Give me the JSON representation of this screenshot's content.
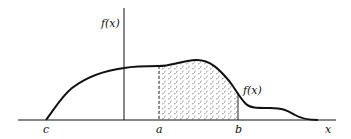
{
  "figure": {
    "type": "probability-density-diagram",
    "y_axis_label": "f(x)",
    "curve_label": "f(x)",
    "x_axis_label": "x",
    "x_markers": [
      "c",
      "a",
      "b"
    ],
    "shaded_region": {
      "from": "a",
      "to": "b",
      "style": "hatched"
    }
  },
  "labels": {
    "yaxis": "f(x)",
    "curve": "f(x)",
    "c": "c",
    "a": "a",
    "b": "b",
    "x": "x"
  },
  "colors": {
    "ink": "#111111",
    "background": "#ffffff"
  }
}
